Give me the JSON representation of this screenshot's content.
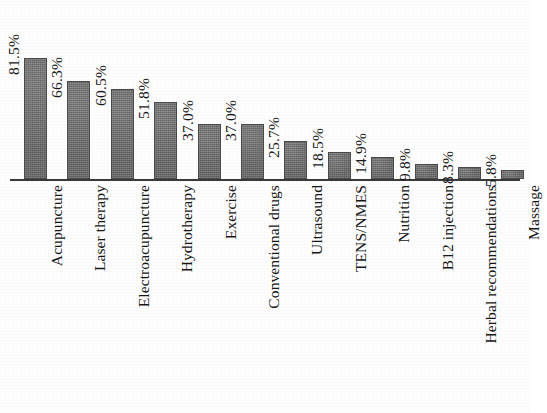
{
  "figure": {
    "background_color": "#ffffff",
    "axis_color": "#3a3a3a",
    "bar_fill_color": "#6d6d6d",
    "bar_border_color": "#4a4a4a",
    "text_color": "#171717"
  },
  "chart_data": {
    "type": "bar",
    "title": "",
    "subtitle": "",
    "xlabel": "",
    "ylabel": "",
    "ylim": [
      0,
      100
    ],
    "grid": false,
    "legend": false,
    "orientation": "vertical",
    "value_suffix": "%",
    "categories": [
      "Acupuncture",
      "Laser therapy",
      "Electroacupuncture",
      "Hydrotherapy",
      "Exercise",
      "Conventional drugs",
      "Ultrasound",
      "TENS/NMES",
      "Nutrition",
      "B12 injection",
      "Herbal recommendations",
      "Massage"
    ],
    "values": [
      81.5,
      66.3,
      60.5,
      51.8,
      37.0,
      37.0,
      25.7,
      18.5,
      14.9,
      9.8,
      8.3,
      5.8
    ],
    "value_labels": [
      "81.5%",
      "66.3%",
      "60.5%",
      "51.8%",
      "37.0%",
      "37.0%",
      "25.7%",
      "18.5%",
      "14.9%",
      "9.8%",
      "8.3%",
      "5.8%"
    ]
  }
}
